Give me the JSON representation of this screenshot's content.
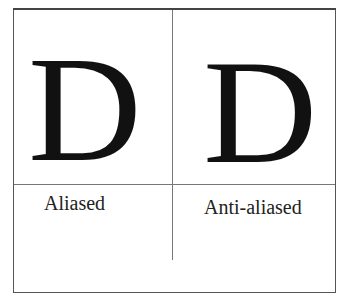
{
  "diagram": {
    "panels": [
      {
        "glyph": "D",
        "label": "Aliased"
      },
      {
        "glyph": "D",
        "label": "Anti-aliased"
      }
    ]
  }
}
